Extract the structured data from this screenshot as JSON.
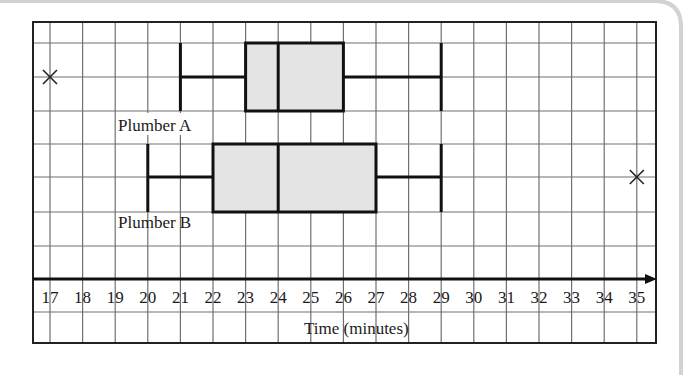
{
  "chart_data": {
    "type": "boxplot",
    "title": "",
    "xlabel": "Time (minutes)",
    "ylabel": "",
    "xlim": [
      17,
      35
    ],
    "x_ticks": [
      17,
      18,
      19,
      20,
      21,
      22,
      23,
      24,
      25,
      26,
      27,
      28,
      29,
      30,
      31,
      32,
      33,
      34,
      35
    ],
    "grid": true,
    "legend": null,
    "series": [
      {
        "name": "Plumber A",
        "min": 21,
        "q1": 23,
        "median": 24,
        "q3": 26,
        "max": 29,
        "outliers": [
          17
        ]
      },
      {
        "name": "Plumber B",
        "min": 20,
        "q1": 22,
        "median": 24,
        "q3": 27,
        "max": 29,
        "outliers": [
          35
        ]
      }
    ]
  },
  "labels": {
    "plumber_a": "Plumber A",
    "plumber_b": "Plumber B",
    "axis_title": "Time (minutes)"
  },
  "colors": {
    "box_fill": "#e4e4e4",
    "grid": "#707070",
    "ink": "#111111",
    "frame": "#cfcfcf"
  }
}
